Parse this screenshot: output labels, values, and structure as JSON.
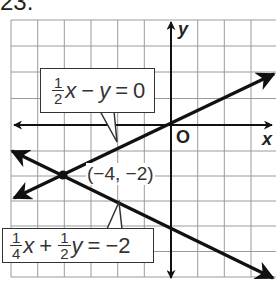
{
  "problem": {
    "number": "23."
  },
  "graph": {
    "axes": {
      "x_label": "x",
      "y_label": "y",
      "origin_label": "O"
    },
    "grid": {
      "x_range": [
        -6,
        3
      ],
      "y_range": [
        -6,
        4
      ],
      "unit": 1
    },
    "lines": [
      {
        "id": "line1",
        "equation": {
          "coef_x": {
            "num": "1",
            "den": "2"
          },
          "x": "x",
          "op": "−",
          "y": "y",
          "eq": "=",
          "rhs": "0"
        },
        "slope_intercept": "y = 0.5x"
      },
      {
        "id": "line2",
        "equation": {
          "coef_x": {
            "num": "1",
            "den": "4"
          },
          "x": "x",
          "op": "+",
          "coef_y": {
            "num": "1",
            "den": "2"
          },
          "y": "y",
          "eq": "=",
          "rhs": "−2"
        },
        "slope_intercept": "y = -0.5x - 4"
      }
    ],
    "intersection": {
      "x": -4,
      "y": -2,
      "label": "(−4, −2)"
    }
  },
  "colors": {
    "line": "#111111",
    "grid": "#9a9a9a",
    "text": "#333333",
    "background": "#ffffff"
  }
}
